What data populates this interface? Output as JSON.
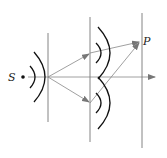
{
  "diagram": {
    "labels": {
      "source": "S",
      "point": "P"
    },
    "colors": {
      "line": "#6e6e6e",
      "wave": "#111111",
      "ray": "#7a7a7a",
      "background": "#ffffff"
    }
  }
}
